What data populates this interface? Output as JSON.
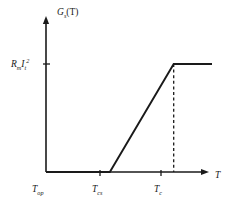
{
  "figure": {
    "name": "heat-generation-vs-temperature",
    "y_axis_label_base": "G",
    "y_axis_label_sub": "s",
    "y_axis_label_paren": "(T)",
    "x_axis_label": "T",
    "y_tick_base1": "R",
    "y_tick_sub1": "m",
    "y_tick_base2": "I",
    "y_tick_sub2": "t",
    "y_tick_sup2": "2",
    "x_tick_1_base": "T",
    "x_tick_1_sub": "op",
    "x_tick_2_base": "T",
    "x_tick_2_sub": "cs",
    "x_tick_3_base": "T",
    "x_tick_3_sub": "c",
    "line_color": "#1a1a1a",
    "background_color": "#ffffff"
  },
  "chart_data": {
    "type": "line",
    "title": "",
    "xlabel": "T",
    "ylabel": "G_s(T)",
    "x_tick_labels": [
      "T_op",
      "T_cs",
      "T_c"
    ],
    "y_tick_labels": [
      "R_m I_t^2"
    ],
    "x_tick_values": [
      0,
      1,
      2
    ],
    "y_tick_values": [
      1
    ],
    "xlim": [
      0,
      2.6
    ],
    "ylim": [
      0,
      1.28
    ],
    "grid": false,
    "legend": false,
    "annotations": [
      {
        "name": "dashed-dropline",
        "type": "vertical-dashed-line",
        "x": 2,
        "y_from": 0,
        "y_to": 1
      }
    ],
    "series": [
      {
        "name": "G_s(T)",
        "style": "solid",
        "color": "#1a1a1a",
        "x": [
          0,
          1,
          2,
          2.6
        ],
        "y": [
          0,
          0,
          1,
          1
        ],
        "description": "Zero from T_op to T_cs, linear ramp from T_cs to T_c reaching R_m I_t^2, then constant plateau."
      }
    ]
  }
}
